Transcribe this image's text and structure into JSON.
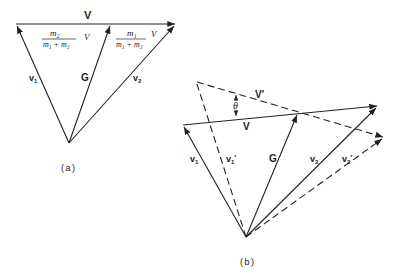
{
  "figure_a": {
    "caption": "(a)",
    "labels": {
      "V": "V",
      "v1": "v",
      "v1_sub": "1",
      "v2": "v",
      "v2_sub": "2",
      "G": "G",
      "frac1_num": "m₂",
      "frac1_den": "m₁ + m₂",
      "frac1_var": "V",
      "frac2_num": "m₁",
      "frac2_den": "m₁ + m₂",
      "frac2_var": "V"
    }
  },
  "figure_b": {
    "caption": "(b)",
    "labels": {
      "V": "V",
      "Vprime": "V′",
      "theta": "θ",
      "v1": "v",
      "v1_sub": "1",
      "v1prime": "v",
      "v1prime_sub": "1",
      "v1prime_mark": "′",
      "G": "G",
      "v2": "v",
      "v2_sub": "2",
      "v2prime": "v",
      "v2prime_sub": "2",
      "v2prime_mark": "′"
    }
  },
  "colors": {
    "line": "#222222",
    "background": "#ffffff"
  }
}
